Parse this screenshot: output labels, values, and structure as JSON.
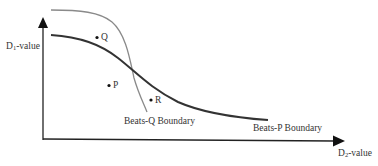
{
  "diagram": {
    "y_axis_label": {
      "main": "D",
      "sub": "1",
      "rest": "-value"
    },
    "x_axis_label": {
      "main": "D",
      "sub": "2",
      "rest": "-value"
    },
    "curves": [
      {
        "name": "Beats-Q Boundary",
        "label": "Beats-Q Boundary",
        "color": "#8a8a8a"
      },
      {
        "name": "Beats-P Boundary",
        "label": "Beats-P Boundary",
        "color": "#333333"
      }
    ],
    "points": [
      {
        "label": "Q"
      },
      {
        "label": "P"
      },
      {
        "label": "R"
      }
    ]
  }
}
